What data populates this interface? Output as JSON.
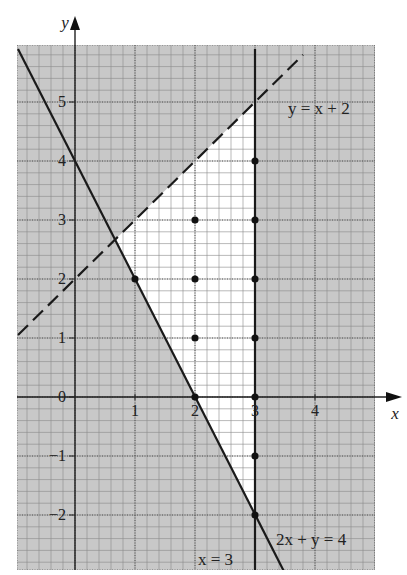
{
  "chart_data": {
    "type": "line",
    "title": "",
    "xlabel": "x",
    "ylabel": "y",
    "xlim": [
      -0.95,
      5.0
    ],
    "ylim": [
      -2.95,
      5.9
    ],
    "grid": true,
    "grid_minor_step": 0.2,
    "x_ticks": [
      {
        "value": 1,
        "label": "1"
      },
      {
        "value": 2,
        "label": "2"
      },
      {
        "value": 3,
        "label": "3"
      },
      {
        "value": 4,
        "label": "4"
      }
    ],
    "y_ticks": [
      {
        "value": 0,
        "label": "0"
      },
      {
        "value": 1,
        "label": "1"
      },
      {
        "value": 2,
        "label": "2"
      },
      {
        "value": 3,
        "label": "3"
      },
      {
        "value": 4,
        "label": "4"
      },
      {
        "value": 5,
        "label": "5"
      },
      {
        "value": -1,
        "label": "−1"
      },
      {
        "value": -2,
        "label": "−2"
      }
    ],
    "series": [
      {
        "name": "2x + y = 4",
        "style": "solid",
        "equation": "y = 4 - 2x",
        "points": [
          [
            -0.95,
            5.9
          ],
          [
            3.48,
            -2.95
          ]
        ],
        "label": "2x + y = 4",
        "label_pos": [
          3.35,
          -2.5
        ]
      },
      {
        "name": "y = x + 2",
        "style": "dashed",
        "equation": "y = x + 2",
        "points": [
          [
            -0.95,
            1.05
          ],
          [
            3.8,
            5.8
          ]
        ],
        "label": "y = x + 2",
        "label_pos": [
          3.55,
          4.8
        ]
      },
      {
        "name": "x = 3",
        "style": "solid",
        "equation": "x = 3",
        "points": [
          [
            3,
            5.9
          ],
          [
            3,
            -2.95
          ]
        ],
        "label": "x = 3",
        "label_pos": [
          2.05,
          -2.85
        ]
      }
    ],
    "shading": {
      "description": "Region outside feasible triangle is shaded grey; unshaded triangle bounded by 2x+y=4, y=x+2, x=3",
      "unshaded_vertices": [
        [
          0.6667,
          2.6667
        ],
        [
          3,
          5
        ],
        [
          3,
          -2
        ]
      ],
      "shade_color": "#c8c8c8"
    },
    "integer_points": [
      [
        1,
        2
      ],
      [
        2,
        3
      ],
      [
        2,
        2
      ],
      [
        2,
        1
      ],
      [
        2,
        0
      ],
      [
        3,
        4
      ],
      [
        3,
        3
      ],
      [
        3,
        2
      ],
      [
        3,
        1
      ],
      [
        3,
        0
      ],
      [
        3,
        -1
      ],
      [
        3,
        -2
      ]
    ]
  }
}
